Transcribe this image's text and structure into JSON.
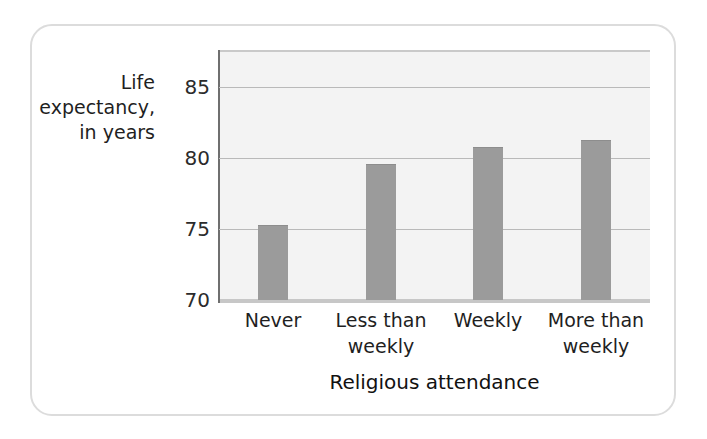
{
  "chart_data": {
    "type": "bar",
    "title": "",
    "xlabel": "Religious attendance",
    "ylabel": "Life expectancy, in years",
    "categories": [
      "Never",
      "Less than weekly",
      "Weekly",
      "More than weekly"
    ],
    "values": [
      75.3,
      79.6,
      80.8,
      81.3
    ],
    "ylim": [
      70,
      87.5
    ],
    "yticks": [
      70,
      75,
      80,
      85
    ],
    "ytick_labels": [
      "70",
      "75",
      "80",
      "85"
    ],
    "grid": true,
    "legend": "none",
    "bar_color": "#9b9b9b",
    "plot_background": "#f3f3f3",
    "gridline_color": "#b9b9b9",
    "axis_color": "#6f6f6f",
    "frame_color": "#dcdcdc"
  },
  "axes": {
    "y_title_lines": [
      "Life",
      "expectancy,",
      "in years"
    ],
    "x_title": "Religious attendance"
  },
  "x_tick_labels": [
    {
      "line1": "Never",
      "line2": ""
    },
    {
      "line1": "Less than",
      "line2": "weekly"
    },
    {
      "line1": "Weekly",
      "line2": ""
    },
    {
      "line1": "More than",
      "line2": "weekly"
    }
  ]
}
